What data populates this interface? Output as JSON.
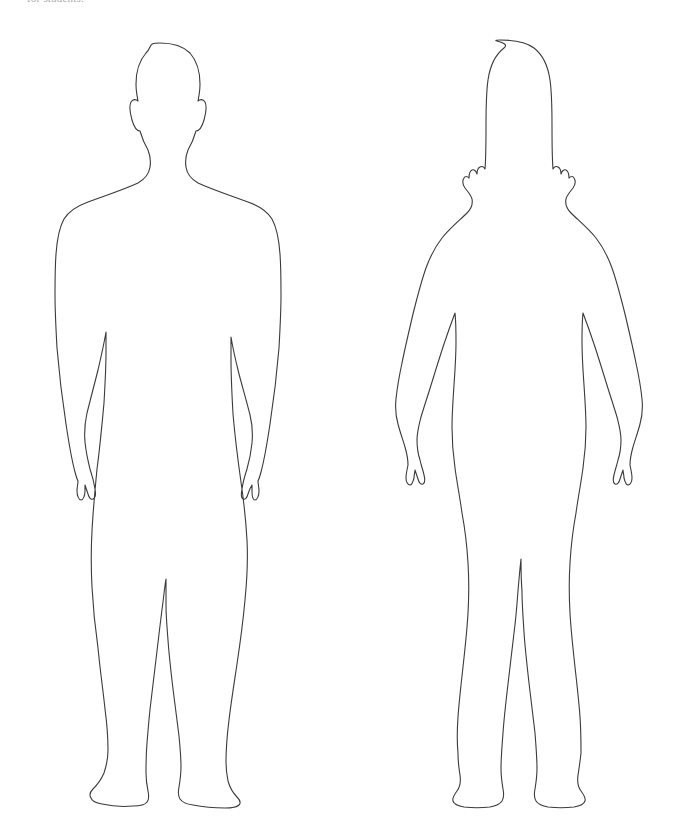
{
  "page": {
    "background_color": "#ffffff",
    "width": 686,
    "height": 831
  },
  "caption": {
    "text": "for students.",
    "color": "#9a9a9a",
    "note": "clipped by top edge of image"
  },
  "figures": [
    {
      "id": "male-figure",
      "label": "Male body outline, front view",
      "icon_name": "male-body-outline-icon",
      "stroke_color": "#3a3a3a",
      "fill_color": "#ffffff",
      "stroke_width": 1.1,
      "bbox": {
        "x": 20,
        "y": 38,
        "width": 280,
        "height": 775
      }
    },
    {
      "id": "female-figure",
      "label": "Female body outline, front view",
      "icon_name": "female-body-outline-icon",
      "stroke_color": "#3a3a3a",
      "fill_color": "#ffffff",
      "stroke_width": 1.1,
      "bbox": {
        "x": 350,
        "y": 38,
        "width": 300,
        "height": 775
      }
    }
  ]
}
